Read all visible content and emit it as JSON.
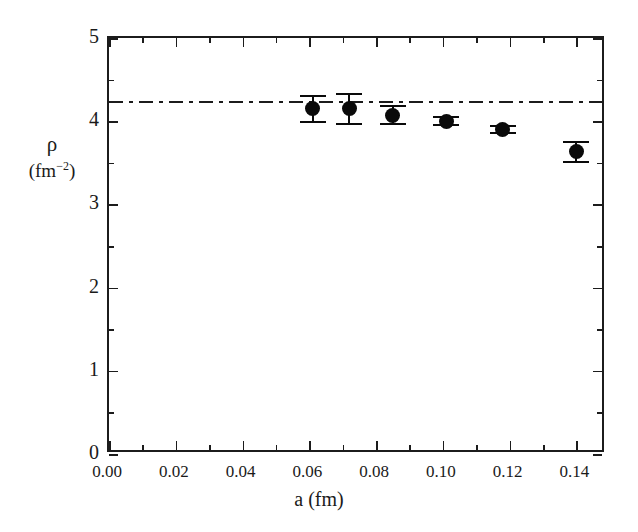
{
  "chart_data": {
    "type": "scatter",
    "title": "",
    "subtitle": "",
    "xlabel": "a (fm)",
    "ylabel": "ρ (fm⁻²)",
    "ylabel_symbol": "ρ",
    "ylabel_unit_open": "(fm",
    "ylabel_unit_exp": "−2",
    "ylabel_unit_close": ")",
    "xlim": [
      0.0,
      0.1489
    ],
    "ylim": [
      0.0,
      5.0
    ],
    "grid": false,
    "legend": null,
    "x_ticks_major": [
      "0.00",
      "0.02",
      "0.04",
      "0.06",
      "0.08",
      "0.10",
      "0.12",
      "0.14"
    ],
    "x_ticks_major_values": [
      0.0,
      0.02,
      0.04,
      0.06,
      0.08,
      0.1,
      0.12,
      0.14
    ],
    "x_ticks_minor_values": [
      0.01,
      0.03,
      0.05,
      0.07,
      0.09,
      0.11,
      0.13
    ],
    "y_ticks_major": [
      "0",
      "1",
      "2",
      "3",
      "4",
      "5"
    ],
    "y_ticks_major_values": [
      0,
      1,
      2,
      3,
      4,
      5
    ],
    "y_ticks_minor_values": [
      0.5,
      1.5,
      2.5,
      3.5,
      4.5
    ],
    "series": [
      {
        "name": "lattice data",
        "marker": "filled-circle",
        "color": "#0a0a0a",
        "x": [
          0.061,
          0.072,
          0.085,
          0.101,
          0.118,
          0.14
        ],
        "y": [
          4.15,
          4.15,
          4.07,
          4.0,
          3.9,
          3.63
        ],
        "yerr": [
          0.17,
          0.19,
          0.12,
          0.06,
          0.05,
          0.13
        ]
      }
    ],
    "annotations": [
      {
        "type": "horizontal-line",
        "name": "reference-line",
        "style": "dash-dot",
        "color": "#1c1c1c",
        "y": 4.24,
        "label": ""
      }
    ]
  }
}
